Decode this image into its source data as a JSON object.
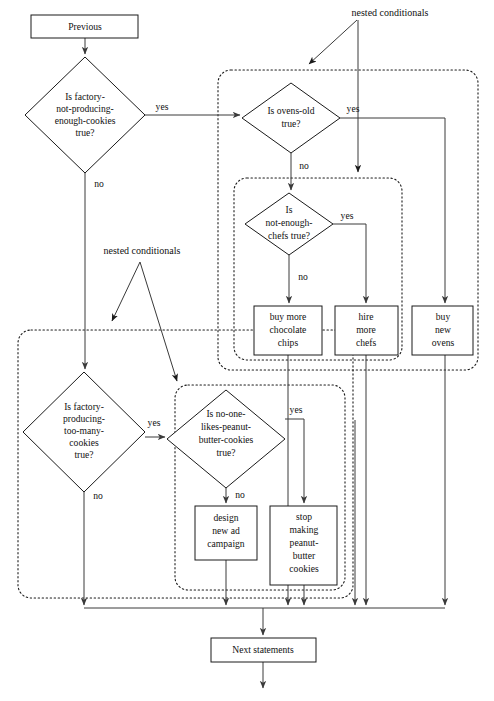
{
  "diagram": {
    "colors": {
      "stroke": "#1a1a1a",
      "connector": "#3a3a3a",
      "fill": "#ffffff",
      "background": "#ffffff"
    },
    "annotations": [
      {
        "id": "annot-top",
        "text": "nested conditionals"
      },
      {
        "id": "annot-bottom",
        "text": "nested conditionals"
      }
    ],
    "edge_labels": {
      "yes": "yes",
      "no": "no"
    },
    "nodes": [
      {
        "id": "previous",
        "type": "process",
        "lines": [
          "Previous"
        ]
      },
      {
        "id": "cond-not-producing-enough",
        "type": "decision",
        "lines": [
          "Is factory-",
          "not-producing-",
          "enough-cookies",
          "true?"
        ]
      },
      {
        "id": "cond-ovens-old",
        "type": "decision",
        "lines": [
          "Is ovens-old",
          "true?"
        ]
      },
      {
        "id": "cond-not-enough-chefs",
        "type": "decision",
        "lines": [
          "Is",
          "not-enough-",
          "chefs true?"
        ]
      },
      {
        "id": "act-buy-chocolate-chips",
        "type": "process",
        "lines": [
          "buy more",
          "chocolate",
          "chips"
        ]
      },
      {
        "id": "act-hire-more-chefs",
        "type": "process",
        "lines": [
          "hire",
          "more",
          "chefs"
        ]
      },
      {
        "id": "act-buy-new-ovens",
        "type": "process",
        "lines": [
          "buy",
          "new",
          "ovens"
        ]
      },
      {
        "id": "cond-producing-too-many",
        "type": "decision",
        "lines": [
          "Is factory-",
          "producing-",
          "too-many-",
          "cookies",
          "true?"
        ]
      },
      {
        "id": "cond-no-one-likes-pb",
        "type": "decision",
        "lines": [
          "Is no-one-",
          "likes-peanut-",
          "butter-cookies",
          "true?"
        ]
      },
      {
        "id": "act-design-ad-campaign",
        "type": "process",
        "lines": [
          "design",
          "new ad",
          "campaign"
        ]
      },
      {
        "id": "act-stop-making-pb",
        "type": "process",
        "lines": [
          "stop",
          "making",
          "peanut-",
          "butter",
          "cookies"
        ]
      },
      {
        "id": "next-statements",
        "type": "process",
        "lines": [
          "Next statements"
        ]
      }
    ]
  },
  "labels": {
    "previous": "Previous",
    "next_statements": "Next statements",
    "nested_conditionals": "nested conditionals",
    "yes": "yes",
    "no": "no",
    "cond1_l1": "Is factory-",
    "cond1_l2": "not-producing-",
    "cond1_l3": "enough-cookies",
    "cond1_l4": "true?",
    "cond2_l1": "Is ovens-old",
    "cond2_l2": "true?",
    "cond3_l1": "Is",
    "cond3_l2": "not-enough-",
    "cond3_l3": "chefs true?",
    "act1_l1": "buy more",
    "act1_l2": "chocolate",
    "act1_l3": "chips",
    "act2_l1": "hire",
    "act2_l2": "more",
    "act2_l3": "chefs",
    "act3_l1": "buy",
    "act3_l2": "new",
    "act3_l3": "ovens",
    "cond4_l1": "Is factory-",
    "cond4_l2": "producing-",
    "cond4_l3": "too-many-",
    "cond4_l4": "cookies",
    "cond4_l5": "true?",
    "cond5_l1": "Is no-one-",
    "cond5_l2": "likes-peanut-",
    "cond5_l3": "butter-cookies",
    "cond5_l4": "true?",
    "act4_l1": "design",
    "act4_l2": "new ad",
    "act4_l3": "campaign",
    "act5_l1": "stop",
    "act5_l2": "making",
    "act5_l3": "peanut-",
    "act5_l4": "butter",
    "act5_l5": "cookies"
  }
}
